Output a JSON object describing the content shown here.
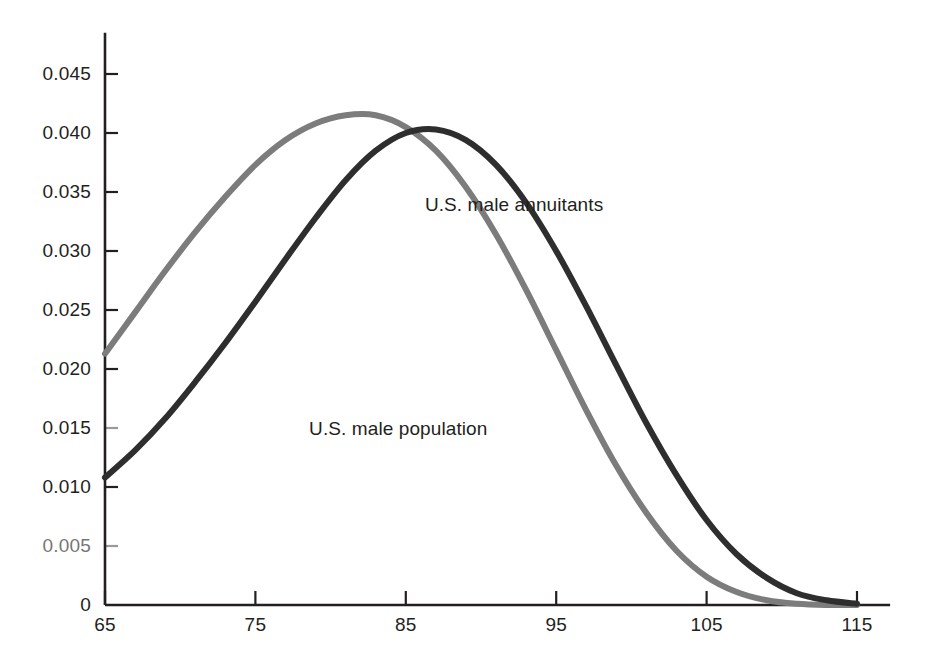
{
  "chart_data": {
    "type": "line",
    "title": "",
    "subtitle": "",
    "xlabel": "",
    "ylabel": "",
    "xlim": [
      65,
      115
    ],
    "ylim": [
      0,
      0.0475
    ],
    "grid": false,
    "legend_position": "inline-annotations",
    "x_ticks": [
      "65",
      "75",
      "85",
      "95",
      "105",
      "115"
    ],
    "x_tick_values": [
      65,
      75,
      85,
      95,
      105,
      115
    ],
    "y_ticks": [
      "0",
      "0.005",
      "0.010",
      "0.015",
      "0.020",
      "0.025",
      "0.030",
      "0.035",
      "0.040",
      "0.045"
    ],
    "y_tick_values": [
      0,
      0.005,
      0.01,
      0.015,
      0.02,
      0.025,
      0.03,
      0.035,
      0.04,
      0.045
    ],
    "x": [
      65,
      67,
      69,
      71,
      73,
      75,
      77,
      79,
      81,
      83,
      85,
      87,
      89,
      91,
      93,
      95,
      97,
      99,
      101,
      103,
      105,
      107,
      109,
      111,
      113,
      115
    ],
    "series": [
      {
        "name": "U.S. male population",
        "color": "#7c7c7c",
        "label_x": 84.5,
        "label_y": 0.0148,
        "values": [
          0.0213,
          0.0248,
          0.0283,
          0.0316,
          0.0346,
          0.0373,
          0.0394,
          0.0408,
          0.0415,
          0.0415,
          0.0405,
          0.0385,
          0.0354,
          0.0314,
          0.0267,
          0.0216,
          0.0165,
          0.0118,
          0.0078,
          0.0046,
          0.0024,
          0.0011,
          0.0004,
          0.0001,
          0.0,
          0.0
        ]
      },
      {
        "name": "U.S. male annuitants",
        "color": "#2e2e2e",
        "label_x": 92.2,
        "label_y": 0.0338,
        "values": [
          0.0108,
          0.0131,
          0.0158,
          0.0189,
          0.0222,
          0.0257,
          0.0293,
          0.0328,
          0.036,
          0.0385,
          0.04,
          0.0403,
          0.0394,
          0.0373,
          0.0341,
          0.03,
          0.0253,
          0.0203,
          0.0154,
          0.011,
          0.0072,
          0.0043,
          0.0023,
          0.001,
          0.0004,
          0.0001
        ]
      }
    ],
    "axis": {
      "color": "#231f20",
      "x_axis_start": 65,
      "x_axis_end": 117.2,
      "y_axis_top": 0.0485
    }
  }
}
